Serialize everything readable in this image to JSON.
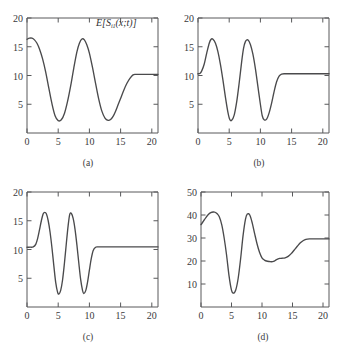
{
  "figure": {
    "background": "#ffffff",
    "axis_color": "#58595b",
    "curve_color": "#4a4a4c",
    "text_color": "#3a3a3c"
  },
  "panels": [
    {
      "id": "a",
      "caption": "(a)",
      "label_main": "E[S",
      "label_sub": "i1",
      "label_tail": "(x;t)]"
    },
    {
      "id": "b",
      "caption": "(b)",
      "label_main": "E[S",
      "label_sub": "i2",
      "label_tail": "(x;t)]"
    },
    {
      "id": "c",
      "caption": "(c)",
      "label_main": "E[S",
      "label_sub": "i3",
      "label_tail": "(x;t)]"
    },
    {
      "id": "d",
      "caption": "(d)",
      "label_main": "E[S",
      "label_sup": "(S)",
      "label_sub": "6|123",
      "label_tail": "(x;t)]"
    }
  ],
  "chart_data": [
    {
      "type": "line",
      "panel": "a",
      "title": "E[S_i1(x;t)]",
      "xlabel": "",
      "ylabel": "",
      "xlim": [
        0,
        21
      ],
      "ylim": [
        0,
        20
      ],
      "xticks": [
        0,
        5,
        10,
        15,
        20
      ],
      "yticks": [
        5,
        10,
        15,
        20
      ],
      "xticklabels": [
        "0",
        "5",
        "10",
        "15",
        "20"
      ],
      "yticklabels": [
        "5",
        "10",
        "15",
        "20"
      ],
      "grid": false,
      "legend": "none",
      "x": [
        0,
        0.4,
        0.8,
        1.2,
        1.6,
        2.0,
        2.5,
        3.0,
        3.5,
        4.0,
        4.5,
        5.0,
        5.5,
        6.0,
        6.5,
        7.0,
        7.5,
        8.0,
        8.4,
        8.8,
        9.2,
        9.6,
        10.0,
        10.5,
        11.0,
        11.5,
        12.0,
        12.5,
        13.0,
        13.4,
        13.8,
        14.2,
        14.6,
        15.0,
        15.5,
        16.0,
        16.5,
        17.0,
        17.4,
        18.0,
        19.0,
        20.0,
        21.0
      ],
      "y": [
        16.3,
        16.5,
        16.5,
        16.2,
        15.6,
        14.6,
        12.9,
        10.6,
        7.8,
        5.1,
        3.0,
        2.15,
        2.3,
        3.4,
        5.5,
        8.2,
        11.3,
        14.1,
        15.6,
        16.35,
        16.2,
        15.3,
        13.9,
        11.4,
        8.6,
        5.9,
        3.8,
        2.6,
        2.2,
        2.35,
        2.9,
        3.8,
        4.9,
        6.0,
        7.4,
        8.6,
        9.5,
        10.1,
        10.2,
        10.2,
        10.2,
        10.2,
        10.2
      ]
    },
    {
      "type": "line",
      "panel": "b",
      "title": "E[S_i2(x;t)]",
      "xlabel": "",
      "ylabel": "",
      "xlim": [
        0,
        21
      ],
      "ylim": [
        0,
        20
      ],
      "xticks": [
        0,
        5,
        10,
        15,
        20
      ],
      "yticks": [
        5,
        10,
        15,
        20
      ],
      "xticklabels": [
        "0",
        "5",
        "10",
        "15",
        "20"
      ],
      "yticklabels": [
        "5",
        "10",
        "15",
        "20"
      ],
      "grid": false,
      "legend": "none",
      "x": [
        0,
        0.3,
        0.6,
        1.0,
        1.4,
        1.8,
        2.1,
        2.4,
        2.8,
        3.2,
        3.6,
        4.0,
        4.4,
        4.8,
        5.1,
        5.4,
        5.8,
        6.2,
        6.6,
        7.0,
        7.3,
        7.6,
        8.0,
        8.4,
        8.8,
        9.2,
        9.6,
        10.0,
        10.3,
        10.6,
        11.0,
        11.4,
        11.8,
        12.2,
        12.6,
        13.0,
        13.4,
        14.0,
        15.0,
        16.5,
        18.0,
        20.0,
        21.0
      ],
      "y": [
        10.3,
        10.35,
        10.8,
        12.0,
        13.9,
        15.6,
        16.3,
        16.3,
        15.6,
        14.1,
        11.9,
        9.2,
        6.2,
        3.6,
        2.35,
        2.2,
        3.1,
        5.4,
        8.7,
        12.4,
        14.7,
        15.9,
        16.2,
        15.4,
        13.7,
        11.2,
        8.1,
        5.0,
        3.0,
        2.3,
        2.4,
        3.5,
        5.2,
        7.2,
        8.9,
        9.9,
        10.25,
        10.3,
        10.3,
        10.3,
        10.3,
        10.3,
        10.3
      ]
    },
    {
      "type": "line",
      "panel": "c",
      "title": "E[S_i3(x;t)]",
      "xlabel": "",
      "ylabel": "",
      "xlim": [
        0,
        21
      ],
      "ylim": [
        0,
        20
      ],
      "xticks": [
        0,
        5,
        10,
        15,
        20
      ],
      "yticks": [
        5,
        10,
        15,
        20
      ],
      "xticklabels": [
        "0",
        "5",
        "10",
        "15",
        "20"
      ],
      "yticklabels": [
        "5",
        "10",
        "15",
        "20"
      ],
      "grid": false,
      "legend": "none",
      "x": [
        0,
        0.5,
        1.0,
        1.4,
        1.7,
        2.0,
        2.3,
        2.6,
        2.85,
        3.1,
        3.4,
        3.7,
        4.0,
        4.3,
        4.6,
        4.9,
        5.1,
        5.4,
        5.7,
        6.0,
        6.3,
        6.6,
        6.85,
        7.1,
        7.4,
        7.7,
        8.0,
        8.3,
        8.6,
        8.9,
        9.1,
        9.4,
        9.7,
        10.0,
        10.3,
        10.6,
        11.0,
        11.4,
        12.0,
        13.0,
        15.0,
        17.0,
        19.0,
        21.0
      ],
      "y": [
        10.4,
        10.4,
        10.45,
        10.9,
        11.9,
        13.4,
        15.0,
        16.2,
        16.45,
        16.2,
        15.0,
        13.0,
        10.3,
        7.2,
        4.3,
        2.6,
        2.25,
        2.9,
        4.7,
        7.6,
        11.0,
        14.2,
        16.1,
        16.3,
        15.4,
        13.5,
        10.8,
        7.7,
        4.8,
        2.9,
        2.35,
        2.8,
        4.3,
        6.4,
        8.4,
        9.8,
        10.4,
        10.45,
        10.45,
        10.45,
        10.45,
        10.45,
        10.45,
        10.45
      ]
    },
    {
      "type": "line",
      "panel": "d",
      "title": "E[S^(S)_6|123(x;t)]",
      "xlabel": "",
      "ylabel": "",
      "xlim": [
        0,
        21
      ],
      "ylim": [
        0,
        50
      ],
      "xticks": [
        0,
        5,
        10,
        15,
        20
      ],
      "yticks": [
        10,
        20,
        30,
        40,
        50
      ],
      "xticklabels": [
        "0",
        "5",
        "10",
        "15",
        "20"
      ],
      "yticklabels": [
        "10",
        "20",
        "30",
        "40",
        "50"
      ],
      "grid": false,
      "legend": "none",
      "x": [
        0,
        0.4,
        0.8,
        1.2,
        1.6,
        2.0,
        2.3,
        2.7,
        3.0,
        3.4,
        3.8,
        4.2,
        4.6,
        5.0,
        5.3,
        5.7,
        6.1,
        6.5,
        6.9,
        7.3,
        7.6,
        8.0,
        8.4,
        8.8,
        9.2,
        9.6,
        10.0,
        10.4,
        10.9,
        11.4,
        11.9,
        12.4,
        12.9,
        13.3,
        13.8,
        14.3,
        14.8,
        15.3,
        15.8,
        16.3,
        16.8,
        17.2,
        17.8,
        19.0,
        20.0,
        21.0
      ],
      "y": [
        35.8,
        37.3,
        38.9,
        40.2,
        41.0,
        41.3,
        41.2,
        40.4,
        39.2,
        35.8,
        30.0,
        22.5,
        13.5,
        7.3,
        6.0,
        7.4,
        12.5,
        21.0,
        31.0,
        38.2,
        40.4,
        40.0,
        36.6,
        31.9,
        27.4,
        23.8,
        21.4,
        20.4,
        19.9,
        19.7,
        19.8,
        20.6,
        21.1,
        21.2,
        21.4,
        22.0,
        23.2,
        24.8,
        26.4,
        27.9,
        28.9,
        29.4,
        29.6,
        29.6,
        29.6,
        29.6
      ]
    }
  ]
}
